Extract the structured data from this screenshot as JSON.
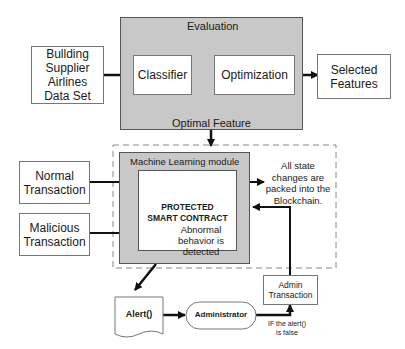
{
  "diagram": {
    "dataset": {
      "lines": [
        "Bullding",
        "Supplier",
        "Airlines",
        "Data Set"
      ]
    },
    "classifier": "Classifier",
    "optimization": "Optimization",
    "evaluation": "Evaluation",
    "optimal_feature": "Optimal Feature",
    "selected_features": {
      "lines": [
        "Selected",
        "Features"
      ]
    },
    "normal_transaction": {
      "lines": [
        "Normal",
        "Transaction"
      ]
    },
    "malicious_transaction": {
      "lines": [
        "Malicious",
        "Transaction"
      ]
    },
    "ml_module": "Machine Learning module",
    "protected_contract": {
      "lines": [
        "PROTECTED",
        "SMART CONTRACT"
      ]
    },
    "abnormal": {
      "lines": [
        "Abnormal",
        "behavior is",
        "detected"
      ]
    },
    "blockchain_note": {
      "lines": [
        "All state",
        "changes are",
        "packed into the",
        "Blockchain."
      ]
    },
    "alert": "Alert()",
    "administrator": "Administrator",
    "admin_transaction": {
      "lines": [
        "Admin",
        "Transaction"
      ]
    },
    "condition": {
      "lines": [
        "IF the alert()",
        "is false"
      ]
    }
  },
  "colors": {
    "gray_fill": "#c8c8c8",
    "line": "#111111",
    "border": "#777777"
  }
}
